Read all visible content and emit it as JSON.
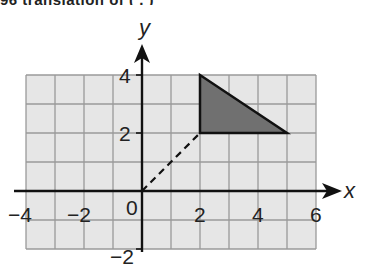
{
  "header": {
    "clipped_text": "96  translation  of  (  ,  )"
  },
  "diagram": {
    "x_axis_label": "x",
    "y_axis_label": "y",
    "x_ticks": [
      {
        "value": -4,
        "label": "−4"
      },
      {
        "value": -2,
        "label": "−2"
      },
      {
        "value": 0,
        "label": "0"
      },
      {
        "value": 2,
        "label": "2"
      },
      {
        "value": 4,
        "label": "4"
      },
      {
        "value": 6,
        "label": "6"
      }
    ],
    "y_ticks": [
      {
        "value": 4,
        "label": "4"
      },
      {
        "value": 2,
        "label": "2"
      },
      {
        "value": -2,
        "label": "−2"
      }
    ],
    "grid": {
      "x_range": [
        -4,
        6
      ],
      "y_range": [
        -2,
        4
      ],
      "step": 1
    },
    "triangle": {
      "vertices": [
        [
          2,
          4
        ],
        [
          2,
          2
        ],
        [
          5,
          2
        ]
      ],
      "fill": "#707070",
      "stroke": "#111111"
    },
    "dashed_segment": {
      "from": [
        0,
        0
      ],
      "to": [
        2,
        2
      ]
    },
    "colors": {
      "grid_fill": "#e6e6e6",
      "grid_line": "#9a9a9a",
      "axis": "#111111"
    }
  }
}
